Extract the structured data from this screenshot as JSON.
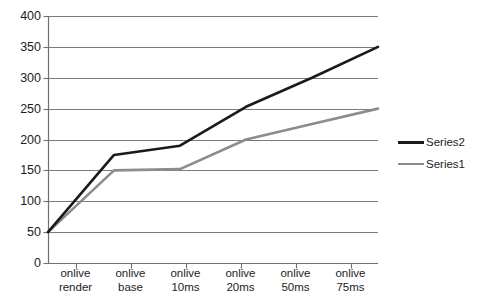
{
  "chart_data": {
    "type": "line",
    "title": "",
    "xlabel": "",
    "ylabel": "",
    "ylim": [
      0,
      400
    ],
    "ytick_step": 50,
    "yticks": [
      "400",
      "350",
      "300",
      "250",
      "200",
      "150",
      "100",
      "50",
      "0"
    ],
    "grid": true,
    "legend_position": "right",
    "categories": [
      "onlive render",
      "onlive base",
      "onlive 10ms",
      "onlive 20ms",
      "onlive 50ms",
      "onlive 75ms"
    ],
    "category_lines": [
      [
        "onlive",
        "render"
      ],
      [
        "onlive",
        "base"
      ],
      [
        "onlive",
        "10ms"
      ],
      [
        "onlive",
        "20ms"
      ],
      [
        "onlive",
        "50ms"
      ],
      [
        "onlive",
        "75ms"
      ]
    ],
    "series": [
      {
        "name": "Series2",
        "color": "#1a1a1a",
        "width": 2.6,
        "values": [
          50,
          175,
          190,
          253,
          300,
          350
        ]
      },
      {
        "name": "Series1",
        "color": "#8c8c8c",
        "width": 2.6,
        "values": [
          50,
          150,
          152,
          200,
          225,
          250
        ]
      }
    ]
  },
  "legend": {
    "entries": [
      {
        "label": "Series2",
        "color": "#1a1a1a"
      },
      {
        "label": "Series1",
        "color": "#8c8c8c"
      }
    ]
  },
  "axes": {
    "axis_color": "#6f6f6f",
    "grid_color": "#7a7a7a"
  }
}
